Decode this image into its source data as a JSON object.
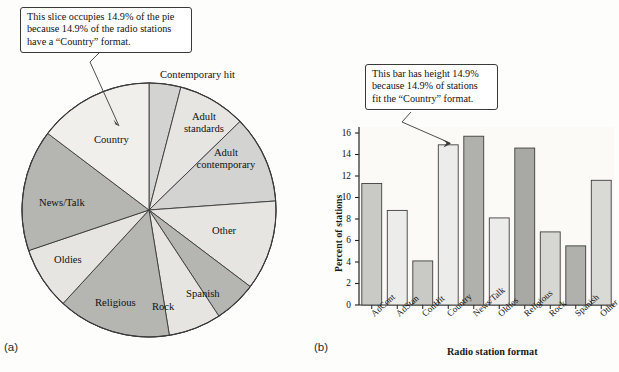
{
  "figure": {
    "panel_a_letter": "(a)",
    "panel_b_letter": "(b)"
  },
  "callouts": {
    "pie": {
      "line1": "This slice occupies 14.9% of the pie",
      "line2": "because 14.9% of the radio stations",
      "line3": "have a “Country” format."
    },
    "bar": {
      "line1": "This bar has height 14.9%",
      "line2": "because 14.9% of stations",
      "line3": "fit the “Country” format."
    }
  },
  "chart_data": [
    {
      "type": "pie",
      "title": "",
      "id": "radio-format-pie",
      "legend": "none",
      "labels_on_slices": true,
      "start_angle_deg": 0,
      "direction": "clockwise",
      "categories": [
        "Contemporary hit",
        "Adult standards",
        "Adult contemporary",
        "Other",
        "Spanish",
        "Rock",
        "Religious",
        "Oldies",
        "News/Talk",
        "Country"
      ],
      "values": [
        4.1,
        8.8,
        11.3,
        11.6,
        5.5,
        6.8,
        14.6,
        8.1,
        15.7,
        14.9
      ],
      "unit": "percent",
      "slice_fills": [
        "#d3d3d1",
        "#e6e5e2",
        "#d3d3d1",
        "#e6e5e2",
        "#b5b5b2",
        "#e6e5e2",
        "#b5b5b2",
        "#e6e5e2",
        "#b5b5b2",
        "#f0efec"
      ],
      "highlight_category": "Country"
    },
    {
      "type": "bar",
      "id": "radio-format-bar",
      "title": "",
      "xlabel": "Radio station format",
      "ylabel": "Percent of stations",
      "categories": [
        "AdCont",
        "AdStan",
        "ConHit",
        "Country",
        "News/Talk",
        "Oldies",
        "Religious",
        "Rock",
        "Spanish",
        "Other"
      ],
      "values": [
        11.3,
        8.8,
        4.1,
        14.9,
        15.7,
        8.1,
        14.6,
        6.8,
        5.5,
        11.6
      ],
      "bar_fills": [
        "#c9c9c6",
        "#ececea",
        "#c9c9c6",
        "#ececea",
        "#b0b0ad",
        "#ececea",
        "#a8a8a5",
        "#d6d6d3",
        "#b0b0ad",
        "#d9d9d6"
      ],
      "ylim": [
        0,
        16
      ],
      "yticks": [
        0,
        2,
        4,
        6,
        8,
        10,
        12,
        14,
        16
      ],
      "ytick_labels": [
        "0",
        "2",
        "4",
        "6",
        "8",
        "10",
        "12",
        "14",
        "16"
      ],
      "grid": false,
      "legend": "none",
      "highlight_category": "Country"
    }
  ],
  "colors": {
    "stroke": "#3a3a3a",
    "text": "#111111",
    "page_bg": "#fdfdfb"
  }
}
